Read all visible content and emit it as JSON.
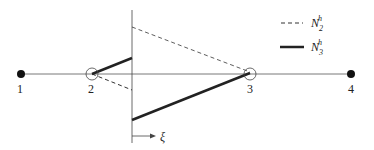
{
  "diagram": {
    "nodes": [
      {
        "id": "1",
        "label": "1",
        "x": 21,
        "filled": true
      },
      {
        "id": "2",
        "label": "2",
        "x": 92,
        "filled": false
      },
      {
        "id": "3",
        "label": "3",
        "x": 250,
        "filled": false
      },
      {
        "id": "4",
        "label": "4",
        "x": 351,
        "filled": true
      }
    ],
    "axis_label": "ξ",
    "legend": [
      {
        "style": "dashed",
        "symbol": "N",
        "superscript": "h",
        "subscript": "2"
      },
      {
        "style": "solid",
        "symbol": "N",
        "superscript": "h",
        "subscript": "3"
      }
    ],
    "colors": {
      "line": "#222222",
      "node_fill": "#111111"
    }
  }
}
